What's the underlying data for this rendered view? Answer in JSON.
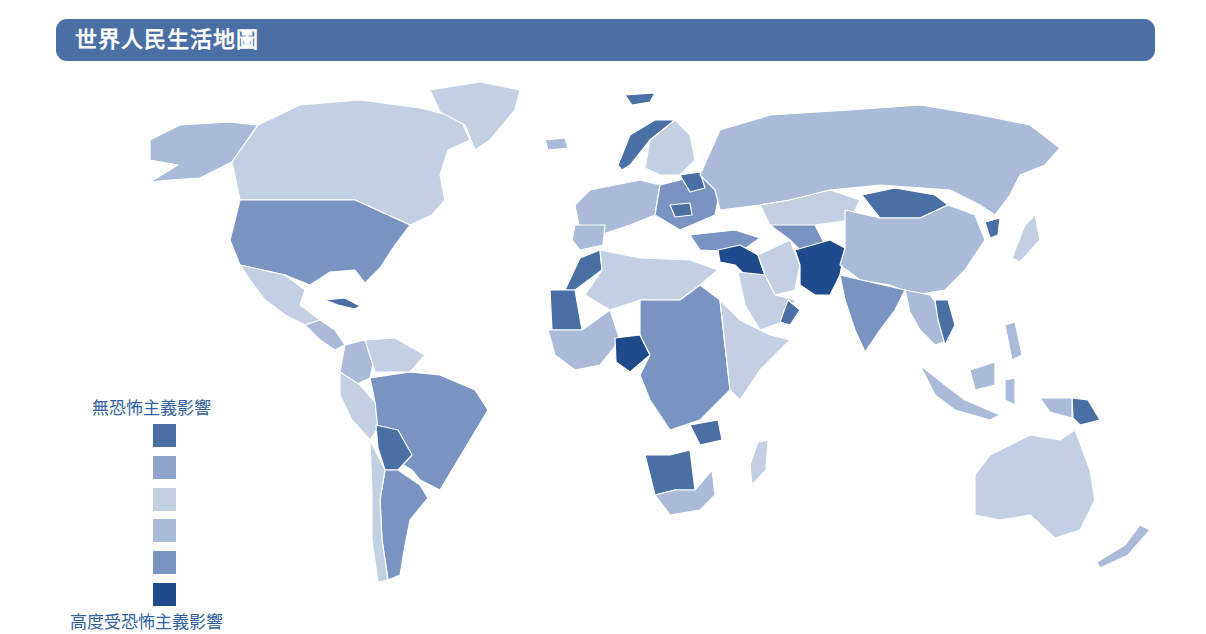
{
  "title": "世界人民生活地圖",
  "colors": {
    "title_bar": "#4a6fa5",
    "legend_text": "#2f5fa0",
    "border": "#ffffff"
  },
  "legend": {
    "top_label": "無恐怖主義影響",
    "bottom_label": "高度受恐怖主義影響",
    "levels": [
      {
        "level": 1,
        "color": "#4a6fa5"
      },
      {
        "level": 2,
        "color": "#8fa5cb"
      },
      {
        "level": 3,
        "color": "#c3d0e4"
      },
      {
        "level": 4,
        "color": "#a9bbd8"
      },
      {
        "level": 5,
        "color": "#7a94c2"
      },
      {
        "level": 6,
        "color": "#1f4a8c"
      }
    ]
  },
  "regions": [
    {
      "name": "Alaska",
      "level": 4
    },
    {
      "name": "Canada",
      "level": 3
    },
    {
      "name": "Greenland",
      "level": 3
    },
    {
      "name": "United States",
      "level": 5
    },
    {
      "name": "Mexico",
      "level": 3
    },
    {
      "name": "Cuba",
      "level": 1
    },
    {
      "name": "Central America",
      "level": 4
    },
    {
      "name": "Colombia",
      "level": 4
    },
    {
      "name": "Venezuela",
      "level": 3
    },
    {
      "name": "Peru",
      "level": 3
    },
    {
      "name": "Brazil",
      "level": 5
    },
    {
      "name": "Bolivia",
      "level": 1
    },
    {
      "name": "Argentina",
      "level": 5
    },
    {
      "name": "Chile",
      "level": 3
    },
    {
      "name": "Norway",
      "level": 1
    },
    {
      "name": "Sweden/Finland",
      "level": 3
    },
    {
      "name": "Western Europe",
      "level": 4
    },
    {
      "name": "Eastern Europe",
      "level": 5
    },
    {
      "name": "Belarus",
      "level": 1
    },
    {
      "name": "Romania",
      "level": 1
    },
    {
      "name": "Russia",
      "level": 4
    },
    {
      "name": "Turkey",
      "level": 5
    },
    {
      "name": "Syria/Iraq",
      "level": 6
    },
    {
      "name": "Kazakhstan",
      "level": 3
    },
    {
      "name": "Afghanistan/Pakistan",
      "level": 6
    },
    {
      "name": "Mongolia",
      "level": 1
    },
    {
      "name": "China",
      "level": 4
    },
    {
      "name": "North Korea",
      "level": 1
    },
    {
      "name": "Japan",
      "level": 3
    },
    {
      "name": "India",
      "level": 5
    },
    {
      "name": "Southeast Asia",
      "level": 4
    },
    {
      "name": "Cambodia",
      "level": 1
    },
    {
      "name": "Indonesia",
      "level": 4
    },
    {
      "name": "Papua New Guinea",
      "level": 1
    },
    {
      "name": "Australia",
      "level": 3
    },
    {
      "name": "New Zealand",
      "level": 4
    },
    {
      "name": "North Africa",
      "level": 3
    },
    {
      "name": "Morocco",
      "level": 1
    },
    {
      "name": "Mauritania",
      "level": 1
    },
    {
      "name": "Nigeria",
      "level": 6
    },
    {
      "name": "Central Africa",
      "level": 5
    },
    {
      "name": "East Africa",
      "level": 3
    },
    {
      "name": "Namibia/Botswana",
      "level": 1
    },
    {
      "name": "South Africa",
      "level": 4
    },
    {
      "name": "Madagascar",
      "level": 3
    },
    {
      "name": "Arabian Peninsula",
      "level": 3
    },
    {
      "name": "Iran",
      "level": 3
    }
  ]
}
